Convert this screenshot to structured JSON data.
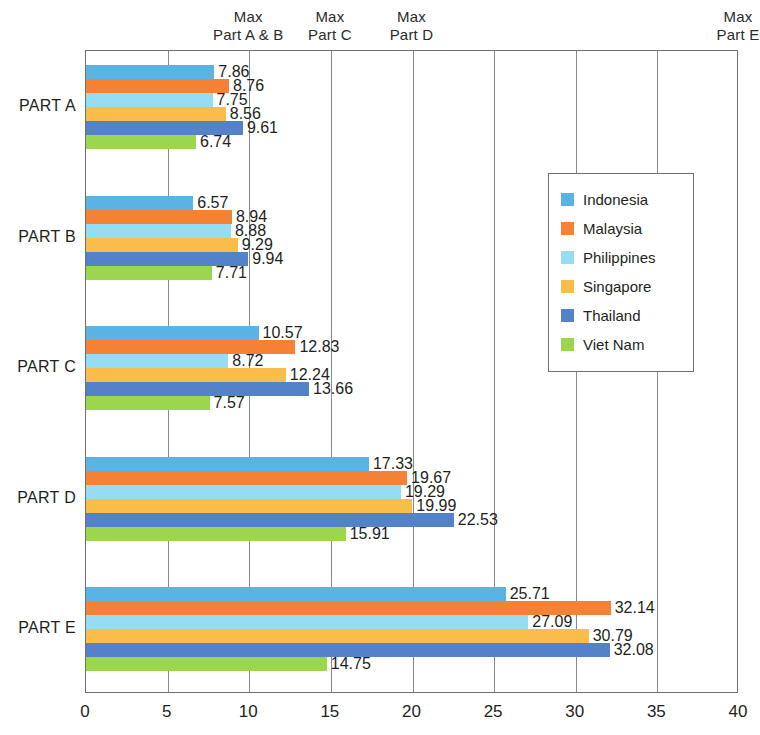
{
  "chart_data": {
    "type": "bar",
    "orientation": "horizontal",
    "title": "",
    "xlabel": "",
    "ylabel": "",
    "xlim": [
      0,
      40
    ],
    "xticks": [
      0,
      5,
      10,
      15,
      20,
      25,
      30,
      35,
      40
    ],
    "xtick_labels": [
      "0",
      "5",
      "10",
      "15",
      "20",
      "25",
      "30",
      "35",
      "40"
    ],
    "grid": true,
    "grid_axis": "x",
    "legend_position": "center-right",
    "categories": [
      "PART A",
      "PART B",
      "PART C",
      "PART D",
      "PART E"
    ],
    "series": [
      {
        "name": "Indonesia",
        "color": "#5BB3E4",
        "values": [
          7.86,
          6.57,
          10.57,
          17.33,
          25.71
        ]
      },
      {
        "name": "Malaysia",
        "color": "#F58234",
        "values": [
          8.76,
          8.94,
          12.83,
          19.67,
          32.14
        ]
      },
      {
        "name": "Philippines",
        "color": "#96DCF2",
        "values": [
          7.75,
          8.88,
          8.72,
          19.29,
          27.09
        ]
      },
      {
        "name": "Singapore",
        "color": "#FBBD4A",
        "values": [
          8.56,
          9.29,
          12.24,
          19.99,
          30.79
        ]
      },
      {
        "name": "Thailand",
        "color": "#5382C8",
        "values": [
          9.61,
          9.94,
          13.66,
          22.53,
          32.08
        ]
      },
      {
        "name": "Viet Nam",
        "color": "#9BD64C",
        "values": [
          6.74,
          7.71,
          7.57,
          15.91,
          14.75
        ]
      }
    ],
    "annotations": [
      {
        "label_line1": "Max",
        "label_line2": "Part A & B",
        "x": 10
      },
      {
        "label_line1": "Max",
        "label_line2": "Part C",
        "x": 15
      },
      {
        "label_line1": "Max",
        "label_line2": "Part D",
        "x": 20
      },
      {
        "label_line1": "Max",
        "label_line2": "Part E",
        "x": 40
      }
    ]
  }
}
